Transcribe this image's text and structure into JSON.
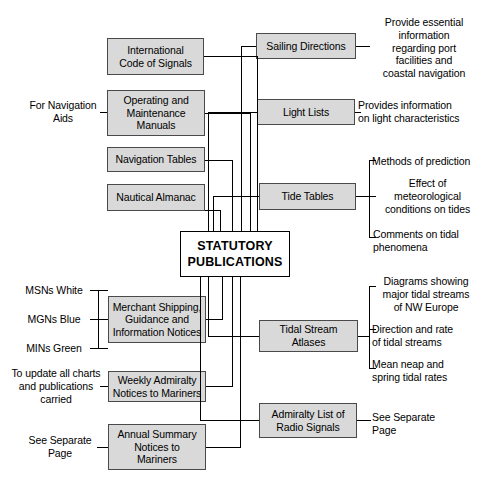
{
  "diagram": {
    "title": "Statutory Publications",
    "center": {
      "label": "STATUTORY\nPUBLICATIONS"
    },
    "left_boxes": [
      {
        "id": "international-code-of-signals",
        "label": "International\nCode of Signals"
      },
      {
        "id": "operating-and-maintenance-manuals",
        "label": "Operating and\nMaintenance\nManuals"
      },
      {
        "id": "navigation-tables",
        "label": "Navigation Tables"
      },
      {
        "id": "nautical-almanac",
        "label": "Nautical Almanac"
      },
      {
        "id": "merchant-shipping-guidance-and-information-notices",
        "label": "Merchant Shipping,\nGuidance and\nInformation Notices"
      },
      {
        "id": "weekly-admiralty-notices-to-mariners",
        "label": "Weekly Admiralty\nNotices to Mariners"
      },
      {
        "id": "annual-summary-notices-to-mariners",
        "label": "Annual Summary\nNotices to\nMariners"
      }
    ],
    "right_boxes": [
      {
        "id": "sailing-directions",
        "label": "Sailing Directions"
      },
      {
        "id": "light-lists",
        "label": "Light Lists"
      },
      {
        "id": "tide-tables",
        "label": "Tide Tables"
      },
      {
        "id": "tidal-stream-atlases",
        "label": "Tidal Stream\nAtlases"
      },
      {
        "id": "admiralty-list-of-radio-signals",
        "label": "Admiralty List of\nRadio Signals"
      }
    ],
    "left_notes": [
      {
        "id": "for-navigation-aids",
        "label": "For Navigation\nAids"
      },
      {
        "id": "msns-white",
        "label": "MSNs White"
      },
      {
        "id": "mgns-blue",
        "label": "MGNs Blue"
      },
      {
        "id": "mins-green",
        "label": "MINs Green"
      },
      {
        "id": "to-update-all-charts",
        "label": "To update all charts\nand publications\ncarried"
      },
      {
        "id": "see-separate-page-left",
        "label": "See Separate\nPage"
      }
    ],
    "right_notes": [
      {
        "id": "sailing-directions-note",
        "label": "Provide essential\ninformation\nregarding port\nfacilities and\ncoastal navigation"
      },
      {
        "id": "light-lists-note",
        "label": "Provides information\non light characteristics"
      },
      {
        "id": "tide-tables-note-1",
        "label": "Methods of prediction"
      },
      {
        "id": "tide-tables-note-2",
        "label": "Effect of\nmeteorological\nconditions on tides"
      },
      {
        "id": "tide-tables-note-3",
        "label": "Comments on tidal\nphenomena"
      },
      {
        "id": "tidal-stream-note-1",
        "label": "Diagrams showing\nmajor tidal streams\nof NW Europe"
      },
      {
        "id": "tidal-stream-note-2",
        "label": "Direction and rate\nof tidal streams"
      },
      {
        "id": "tidal-stream-note-3",
        "label": "Mean neap and\nspring tidal rates"
      },
      {
        "id": "radio-signals-note",
        "label": "See Separate\nPage"
      }
    ],
    "colors": {
      "box_fill": "#d9d9d9",
      "box_border": "#4a4a4a",
      "center_fill": "#ffffff",
      "center_border": "#000000",
      "line": "#000000",
      "background": "#ffffff",
      "text": "#000000"
    }
  }
}
